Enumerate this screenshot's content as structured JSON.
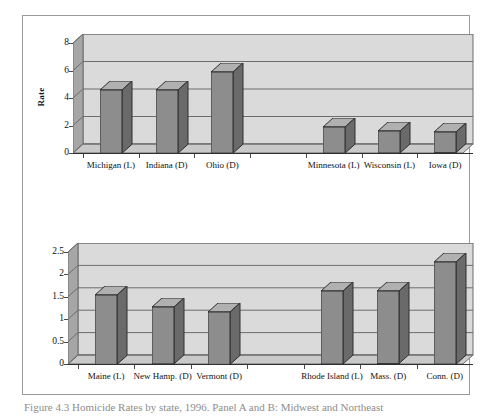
{
  "figure": {
    "caption": "Figure 4.3   Homicide Rates by state, 1996. Panel A and B: Midwest and Northeast"
  },
  "chart_data": [
    {
      "id": "top",
      "type": "bar",
      "title": "",
      "xlabel": "",
      "ylabel": "Rate",
      "ylim": [
        0,
        8
      ],
      "yticks": [
        0,
        2,
        4,
        6,
        8
      ],
      "ytick_labels": [
        "0",
        "2",
        "4",
        "6",
        "8"
      ],
      "grid": true,
      "legend": "none",
      "categories": [
        "Michigan (L)",
        "Indiana (D)",
        "Ohio (D)",
        "",
        "Minnesota (L)",
        "Wisconsin (L)",
        "Iowa (D)"
      ],
      "values": [
        4.6,
        4.6,
        5.9,
        null,
        1.9,
        1.6,
        1.5
      ],
      "series": [
        {
          "name": "Rate",
          "values": [
            4.6,
            4.6,
            5.9,
            null,
            1.9,
            1.6,
            1.5
          ]
        }
      ]
    },
    {
      "id": "bottom",
      "type": "bar",
      "title": "",
      "xlabel": "",
      "ylabel": "",
      "ylim": [
        0,
        2.5
      ],
      "yticks": [
        0,
        0.5,
        1,
        1.5,
        2,
        2.5
      ],
      "ytick_labels": [
        "0",
        "0.5",
        "1",
        "1.5",
        "2",
        "2.5"
      ],
      "grid": true,
      "legend": "none",
      "categories": [
        "Maine (L)",
        "New Hamp. (D)",
        "Vermont (D)",
        "",
        "Rhode Island (L)",
        "Mass. (D)",
        "Conn. (D)"
      ],
      "values": [
        1.55,
        1.27,
        1.17,
        null,
        1.63,
        1.62,
        2.28
      ],
      "series": [
        {
          "name": "Rate",
          "values": [
            1.55,
            1.27,
            1.17,
            null,
            1.63,
            1.62,
            2.28
          ]
        }
      ]
    }
  ]
}
